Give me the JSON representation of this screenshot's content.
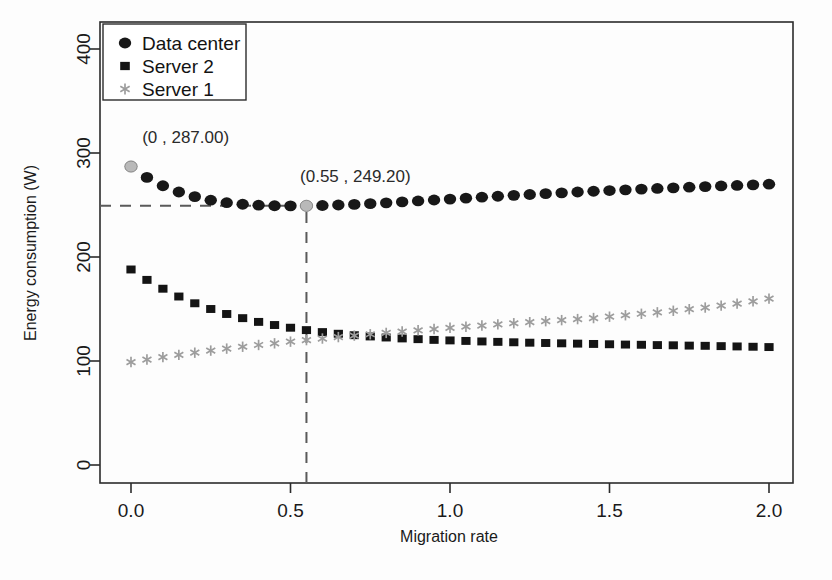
{
  "chart_data": {
    "type": "scatter",
    "title": "",
    "xlabel": "Migration rate",
    "ylabel": "Energy consumption (W)",
    "xlim": [
      0,
      2.0
    ],
    "ylim": [
      0,
      400
    ],
    "xticks": [
      "0.0",
      "0.5",
      "1.0",
      "1.5",
      "2.0"
    ],
    "xtick_values": [
      0,
      0.5,
      1.0,
      1.5,
      2.0
    ],
    "yticks": [
      "0",
      "100",
      "200",
      "300",
      "400"
    ],
    "ytick_values": [
      0,
      100,
      200,
      300,
      400
    ],
    "grid": false,
    "legend_position": "top-left",
    "x": [
      0,
      0.05,
      0.1,
      0.15,
      0.2,
      0.25,
      0.3,
      0.35,
      0.4,
      0.45,
      0.5,
      0.55,
      0.6,
      0.65,
      0.7,
      0.75,
      0.8,
      0.85,
      0.9,
      0.95,
      1.0,
      1.05,
      1.1,
      1.15,
      1.2,
      1.25,
      1.3,
      1.35,
      1.4,
      1.45,
      1.5,
      1.55,
      1.6,
      1.65,
      1.7,
      1.75,
      1.8,
      1.85,
      1.9,
      1.95,
      2.0
    ],
    "series": [
      {
        "name": "Data center",
        "marker": "circle",
        "color": "#181818",
        "values": [
          287.0,
          276.5,
          268.5,
          262.5,
          258.0,
          254.6,
          252.2,
          250.7,
          249.8,
          249.3,
          249.2,
          249.2,
          249.5,
          250.0,
          250.6,
          251.3,
          252.1,
          253.0,
          253.9,
          254.8,
          255.7,
          256.6,
          257.5,
          258.4,
          259.3,
          260.1,
          260.9,
          261.7,
          262.5,
          263.2,
          263.9,
          264.6,
          265.3,
          265.9,
          266.5,
          267.1,
          267.7,
          268.3,
          268.8,
          269.4,
          270.0
        ]
      },
      {
        "name": "Server 2",
        "marker": "square",
        "color": "#141414",
        "values": [
          188.0,
          178.0,
          169.5,
          162.0,
          155.5,
          150.0,
          145.2,
          141.2,
          137.6,
          134.6,
          132.0,
          129.7,
          127.8,
          126.2,
          124.8,
          123.6,
          122.6,
          121.7,
          121.0,
          120.3,
          119.8,
          119.3,
          118.8,
          118.4,
          118.0,
          117.6,
          117.3,
          117.0,
          116.7,
          116.4,
          116.1,
          115.8,
          115.6,
          115.3,
          115.1,
          114.8,
          114.6,
          114.3,
          114.0,
          113.7,
          113.4
        ]
      },
      {
        "name": "Server 1",
        "marker": "star",
        "color": "#9d9d9d",
        "values": [
          99.0,
          101.4,
          103.7,
          105.9,
          108.0,
          110.0,
          111.9,
          113.7,
          115.4,
          117.0,
          118.6,
          120.1,
          121.6,
          123.0,
          124.4,
          125.7,
          127.0,
          128.3,
          129.5,
          130.7,
          131.9,
          133.0,
          134.1,
          135.2,
          136.3,
          137.3,
          138.3,
          139.3,
          140.3,
          141.3,
          142.6,
          144.0,
          145.4,
          146.8,
          148.3,
          149.8,
          151.4,
          153.2,
          155.2,
          157.4,
          160.0
        ]
      }
    ],
    "annotations": [
      {
        "label": "(0 , 287.00)",
        "x": 0,
        "y": 287.0,
        "text_x": 0.035,
        "text_y": 310,
        "highlight": true
      },
      {
        "label": "(0.55 , 249.20)",
        "x": 0.55,
        "y": 249.2,
        "text_x": 0.53,
        "text_y": 272,
        "highlight": true
      }
    ],
    "guides": [
      {
        "type": "horizontal",
        "y": 249.2,
        "from_x": 0,
        "to_x": 0.55
      },
      {
        "type": "vertical",
        "x": 0.55,
        "from_y": 0,
        "to_y": 249.2
      }
    ]
  },
  "legend": {
    "items": [
      {
        "label": "Data center",
        "marker": "circle"
      },
      {
        "label": "Server 2",
        "marker": "square"
      },
      {
        "label": "Server 1",
        "marker": "star"
      }
    ]
  }
}
